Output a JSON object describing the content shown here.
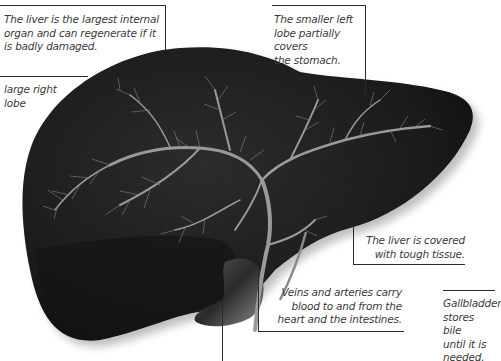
{
  "diagram": {
    "colors": {
      "liver": "#1e1e1e",
      "vessels": "#9a9a9a",
      "text": "#3a3a3a",
      "leader_lines": "#2a2a2a",
      "background": "#ffffff"
    },
    "annotations": [
      {
        "id": "largest-organ",
        "text": "The liver is the largest internal organ and can regenerate if it is badly damaged.",
        "lines": [
          "The liver is the largest internal",
          "organ and can regenerate if it",
          "is badly damaged."
        ]
      },
      {
        "id": "left-lobe",
        "text": "The smaller left lobe partially covers the stomach.",
        "lines": [
          "The smaller left",
          "lobe partially covers",
          "the stomach."
        ]
      },
      {
        "id": "right-lobe",
        "text": "large right lobe",
        "lines": [
          "large right",
          "lobe"
        ]
      },
      {
        "id": "tough-tissue",
        "text": "The liver is covered with tough tissue.",
        "lines": [
          "The liver is covered",
          "with tough tissue."
        ]
      },
      {
        "id": "veins-arteries",
        "text": "Veins and arteries carry blood to and from the heart and the intestines.",
        "lines": [
          "Veins and arteries carry",
          "blood to and from the",
          "heart and the intestines."
        ]
      },
      {
        "id": "gallbladder",
        "text": "Gallbladder stores bile until it is needed.",
        "lines": [
          "Gallbladder",
          "stores bile",
          "until it is",
          "needed."
        ]
      }
    ]
  }
}
